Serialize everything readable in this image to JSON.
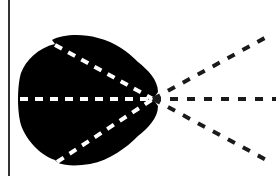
{
  "diagram": {
    "colors": {
      "background": "#ffffff",
      "blob": "#000000",
      "inner_dashes": "#ffffff",
      "outer_dashes": "#1a1a1a",
      "border": "#333333"
    },
    "focal_point": {
      "x": 153,
      "y": 99
    },
    "border": {
      "x": 9,
      "y1": 0,
      "y2": 176
    },
    "inner_lines": [
      {
        "name": "upper",
        "x1": 55,
        "y1": 45,
        "x2": 153,
        "y2": 99
      },
      {
        "name": "middle",
        "x1": 20,
        "y1": 99,
        "x2": 153,
        "y2": 99
      },
      {
        "name": "lower",
        "x1": 57,
        "y1": 162,
        "x2": 153,
        "y2": 99
      }
    ],
    "outer_lines": [
      {
        "name": "upper",
        "x1": 153,
        "y1": 99,
        "x2": 272,
        "y2": 34
      },
      {
        "name": "middle",
        "x1": 153,
        "y1": 99,
        "x2": 276,
        "y2": 99
      },
      {
        "name": "lower",
        "x1": 153,
        "y1": 99,
        "x2": 272,
        "y2": 163
      }
    ]
  }
}
